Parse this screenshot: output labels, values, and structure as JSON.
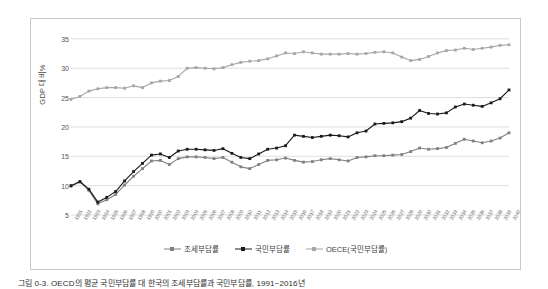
{
  "caption": "그림 0-3. OECD의 평균 국민부담률 대 한국의 조세부담률과 국민부담률, 1991~2016년",
  "axes": {
    "ylabel": "GDP 대비%",
    "yticks": [
      "5",
      "10",
      "15",
      "20",
      "25",
      "30",
      "35"
    ]
  },
  "legend": {
    "items": [
      {
        "label": "조세부담률",
        "color": "#808080"
      },
      {
        "label": "국민부담률",
        "color": "#1a1a1a"
      },
      {
        "label": "OECE(국민부담률)",
        "color": "#a6a6a6"
      }
    ]
  },
  "chart_data": {
    "type": "line",
    "title": "",
    "xlabel": "",
    "ylabel": "GDP 대비%",
    "ylim": [
      5,
      36
    ],
    "yticks": [
      5,
      10,
      15,
      20,
      25,
      30,
      35
    ],
    "grid": "horizontal",
    "legend_position": "bottom",
    "x": [
      "1991",
      "1992",
      "1993",
      "1994",
      "1995",
      "1996",
      "1997",
      "1998",
      "1999",
      "2000",
      "2001",
      "2002",
      "2003",
      "2004",
      "2005",
      "2006",
      "2007",
      "2008",
      "2009",
      "2010",
      "2011",
      "2012",
      "2013",
      "2014",
      "2015",
      "2016",
      "2017",
      "2018",
      "2019",
      "2020",
      "2021",
      "2022",
      "2023",
      "2024",
      "2025",
      "2026",
      "2027",
      "2028",
      "2029",
      "2030",
      "2031",
      "2032",
      "2033",
      "2034",
      "2035",
      "2036",
      "2037",
      "2038",
      "2039",
      "2040"
    ],
    "categories": [
      "1991",
      "1992",
      "1993",
      "1994",
      "1995",
      "1996",
      "1997",
      "1998",
      "1999",
      "2000",
      "2001",
      "2002",
      "2003",
      "2004",
      "2005",
      "2006",
      "2007",
      "2008",
      "2009",
      "2010",
      "2011",
      "2012",
      "2013",
      "2014",
      "2015",
      "2016",
      "2017",
      "2018",
      "2019",
      "2020",
      "2021",
      "2022",
      "2023",
      "2024",
      "2025",
      "2026",
      "2027",
      "2028",
      "2029",
      "2030",
      "2031",
      "2032",
      "2033",
      "2034",
      "2035",
      "2036",
      "2037",
      "2038",
      "2039",
      "2040"
    ],
    "series": [
      {
        "name": "조세부담률",
        "color": "#808080",
        "marker": "square",
        "values": [
          9.9,
          10.6,
          9.2,
          6.9,
          7.6,
          8.5,
          10.1,
          11.6,
          12.9,
          14.2,
          14.3,
          13.6,
          14.6,
          14.9,
          14.9,
          14.8,
          14.6,
          14.8,
          14.0,
          13.2,
          12.9,
          13.6,
          14.3,
          14.4,
          14.7,
          14.3,
          14.0,
          14.1,
          14.4,
          14.6,
          14.4,
          14.2,
          14.8,
          14.9,
          15.1,
          15.1,
          15.2,
          15.3,
          15.8,
          16.4,
          16.2,
          16.3,
          16.5,
          17.2,
          17.9,
          17.6,
          17.3,
          17.6,
          18.1,
          19.0
        ]
      },
      {
        "name": "국민부담률",
        "color": "#1a1a1a",
        "marker": "square",
        "values": [
          10.0,
          10.7,
          9.4,
          7.2,
          8.0,
          9.0,
          10.8,
          12.4,
          13.8,
          15.2,
          15.4,
          14.8,
          15.9,
          16.2,
          16.2,
          16.1,
          16.0,
          16.3,
          15.5,
          14.8,
          14.6,
          15.4,
          16.2,
          16.4,
          16.8,
          18.6,
          18.4,
          18.2,
          18.4,
          18.6,
          18.5,
          18.3,
          19.0,
          19.3,
          20.5,
          20.6,
          20.7,
          20.9,
          21.5,
          22.8,
          22.3,
          22.2,
          22.4,
          23.4,
          23.9,
          23.7,
          23.5,
          24.1,
          24.8,
          26.3
        ]
      },
      {
        "name": "OECE(국민부담률)",
        "color": "#a6a6a6",
        "marker": "square",
        "values": [
          24.7,
          25.2,
          26.1,
          26.5,
          26.7,
          26.7,
          26.6,
          27.0,
          26.7,
          27.5,
          27.8,
          27.9,
          28.6,
          30.0,
          30.1,
          30.0,
          29.9,
          30.1,
          30.6,
          31.0,
          31.2,
          31.3,
          31.6,
          32.1,
          32.6,
          32.5,
          32.8,
          32.6,
          32.4,
          32.4,
          32.4,
          32.5,
          32.4,
          32.5,
          32.7,
          32.8,
          32.6,
          31.9,
          31.3,
          31.5,
          32.0,
          32.6,
          33.0,
          33.1,
          33.4,
          33.2,
          33.4,
          33.6,
          33.9,
          34.0
        ]
      }
    ]
  }
}
